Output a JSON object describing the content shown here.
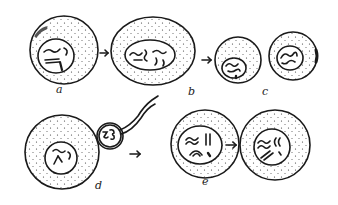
{
  "figure": {
    "type": "hand-drawn cell diagram",
    "ink_color": "#1a1a1a",
    "background": "#ffffff"
  },
  "labels": {
    "a": "a",
    "b": "b",
    "c": "c",
    "d": "d",
    "e": "e"
  },
  "cells": [
    {
      "id": "a",
      "cx": 64,
      "cy": 50,
      "r": 34,
      "nucleus": {
        "cx": 56,
        "cy": 56,
        "rx": 18,
        "ry": 17
      }
    },
    {
      "id": "b",
      "cx": 153,
      "cy": 51,
      "rx": 42,
      "ry": 34,
      "nucleus": {
        "cx": 150,
        "cy": 55,
        "rx": 25,
        "ry": 15
      }
    },
    {
      "id": "c1",
      "cx": 238,
      "cy": 60,
      "r": 23,
      "nucleus": {
        "cx": 234,
        "cy": 68,
        "rx": 12,
        "ry": 10
      }
    },
    {
      "id": "c2",
      "cx": 293,
      "cy": 56,
      "r": 24,
      "nucleus": {
        "cx": 290,
        "cy": 58,
        "rx": 13,
        "ry": 12
      }
    },
    {
      "id": "d",
      "cx": 62,
      "cy": 152,
      "r": 37,
      "nucleus": {
        "cx": 61,
        "cy": 158,
        "rx": 16,
        "ry": 16
      }
    },
    {
      "id": "d-polar",
      "cx": 110,
      "cy": 136,
      "r": 13
    },
    {
      "id": "e",
      "cx": 205,
      "cy": 144,
      "r": 34,
      "nucleus": {
        "cx": 200,
        "cy": 145,
        "rx": 22,
        "ry": 19
      }
    },
    {
      "id": "f",
      "cx": 275,
      "cy": 145,
      "r": 35,
      "nucleus": {
        "cx": 272,
        "cy": 147,
        "rx": 18,
        "ry": 18
      }
    }
  ],
  "arrows": [
    {
      "from": "a",
      "to": "b"
    },
    {
      "from": "b",
      "to": "c"
    },
    {
      "from": "d",
      "to": "e"
    },
    {
      "from": "e",
      "to": "f"
    }
  ]
}
